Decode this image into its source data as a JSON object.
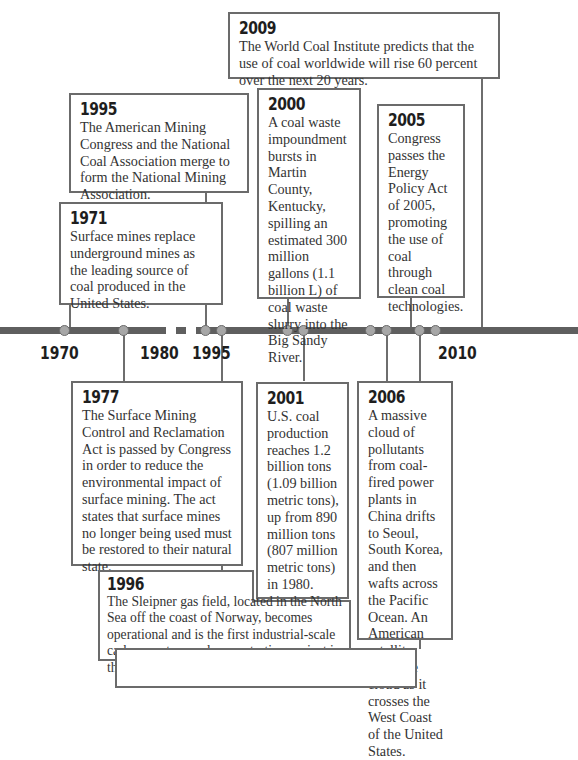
{
  "timeline": {
    "axis_labels": [
      "1970",
      "1980",
      "1995",
      "2010"
    ],
    "events": [
      {
        "year": "2009",
        "text": "The World Coal Institute predicts that the use of coal worldwide will rise 60 percent over the next 20 years."
      },
      {
        "year": "1995",
        "text": "The American Mining Congress and the National Coal Association merge to form the National Mining Association."
      },
      {
        "year": "2000",
        "text": "A coal waste impoundment bursts in Martin County, Kentucky, spilling an estimated 300 million gallons (1.1 billion L) of coal waste slurry into the Big Sandy River."
      },
      {
        "year": "2005",
        "text": "Congress passes the Energy Policy Act of 2005, promoting the use of coal through clean coal technologies."
      },
      {
        "year": "1971",
        "text": "Surface mines replace underground mines as the leading source of coal produced in the United States."
      },
      {
        "year": "1977",
        "text": "The Surface Mining Control and Reclamation Act is passed by Congress in order to reduce the environmental impact of surface mining. The act states that surface mines no longer being used must be restored to their natural state."
      },
      {
        "year": "2001",
        "text": "U.S. coal production reaches 1.2 billion tons (1.09 billion metric tons), up from 890 million tons (807 million metric tons) in 1980."
      },
      {
        "year": "2006",
        "text": "A massive cloud of pollutants from coal-fired power plants in China drifts to Seoul, South Korea, and then wafts across the Pacific Ocean. An American satellite spots the cloud as it crosses the West Coast of the United States."
      },
      {
        "year": "1996",
        "text": "The Sleipner gas field, located in the North Sea off the coast of Norway, becomes operational and is the first industrial-scale carbon capture and sequestration project in the world."
      }
    ]
  },
  "colors": {
    "axis": "#5f5f5f",
    "dot_fill": "#a7a7a7",
    "border": "#6b6b6b"
  }
}
